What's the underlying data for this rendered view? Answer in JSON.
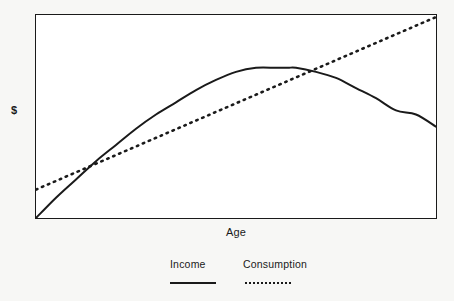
{
  "chart_data": {
    "type": "line",
    "title": "",
    "xlabel": "Age",
    "ylabel": "$",
    "grid": false,
    "legend_position": "bottom",
    "xlim": [
      0,
      100
    ],
    "ylim": [
      0,
      100
    ],
    "axis_ticks": {
      "x": [],
      "y": []
    },
    "series": [
      {
        "name": "Income",
        "style": "solid",
        "color": "#1a1a1a",
        "shape": "concave-down parabola rising from origin to a peak then declining",
        "x": [
          0,
          5,
          10,
          15,
          20,
          25,
          30,
          35,
          40,
          45,
          50,
          55,
          60,
          63,
          65,
          70,
          75,
          80,
          85,
          90,
          95,
          100
        ],
        "y": [
          0,
          10,
          19,
          28,
          36,
          44,
          51,
          57,
          63,
          68,
          72,
          74,
          74,
          74,
          74,
          72,
          69,
          64,
          59,
          53,
          51,
          45
        ]
      },
      {
        "name": "Consumption",
        "style": "dotted",
        "color": "#1a1a1a",
        "shape": "straight rising line",
        "x": [
          0,
          100
        ],
        "y": [
          14,
          99
        ]
      }
    ],
    "annotations": [
      {
        "label": "first crossing",
        "x": 11,
        "y": 23
      },
      {
        "label": "second crossing",
        "x": 71,
        "y": 72
      }
    ]
  },
  "axes": {
    "y_title": "$",
    "x_title": "Age"
  },
  "legend": {
    "entries": [
      {
        "label": "Income",
        "swatch": "solid-line"
      },
      {
        "label": "Consumption",
        "swatch": "dotted-line"
      }
    ]
  },
  "colors": {
    "line": "#1a1a1a",
    "frame": "#1a1a1a",
    "plot_background": "#ffffff",
    "page_background": "#f7f7f5"
  }
}
